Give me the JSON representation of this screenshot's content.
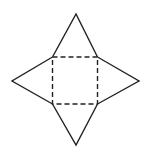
{
  "diagram": {
    "type": "net-of-square-pyramid",
    "stroke_color": "#222222",
    "background": "#ffffff",
    "base_square": {
      "x1": 52.5,
      "y1": 57,
      "x2": 97.5,
      "y2": 104,
      "style": "dashed"
    },
    "triangles": [
      {
        "name": "top",
        "apex": [
          76,
          14
        ]
      },
      {
        "name": "right",
        "apex": [
          139,
          81
        ]
      },
      {
        "name": "bottom",
        "apex": [
          76,
          145
        ]
      },
      {
        "name": "left",
        "apex": [
          12,
          81
        ]
      }
    ]
  }
}
